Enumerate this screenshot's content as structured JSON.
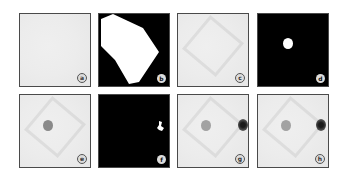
{
  "figure": {
    "panels": [
      {
        "id": "a",
        "label": "a",
        "type": "grayscale",
        "description": "uniform light gray texture"
      },
      {
        "id": "b",
        "label": "b",
        "type": "binary-mask",
        "description": "large white polygon region on black"
      },
      {
        "id": "c",
        "label": "c",
        "type": "grayscale",
        "description": "faint diamond outline on light gray"
      },
      {
        "id": "d",
        "label": "d",
        "type": "binary-mask",
        "description": "small white blob on black"
      },
      {
        "id": "e",
        "label": "e",
        "type": "grayscale",
        "description": "diamond outline with dark spot at left"
      },
      {
        "id": "f",
        "label": "f",
        "type": "binary-mask",
        "description": "small white fragment at right on black"
      },
      {
        "id": "g",
        "label": "g",
        "type": "grayscale",
        "description": "diamond with gray spot left and dark spot right"
      },
      {
        "id": "h",
        "label": "h",
        "type": "grayscale",
        "description": "diamond with gray spot left and dark spot right"
      }
    ],
    "colors": {
      "border": "#4a4a4a",
      "light_bg": "#ececec",
      "mask_bg": "#000000",
      "mask_fg": "#ffffff"
    }
  }
}
